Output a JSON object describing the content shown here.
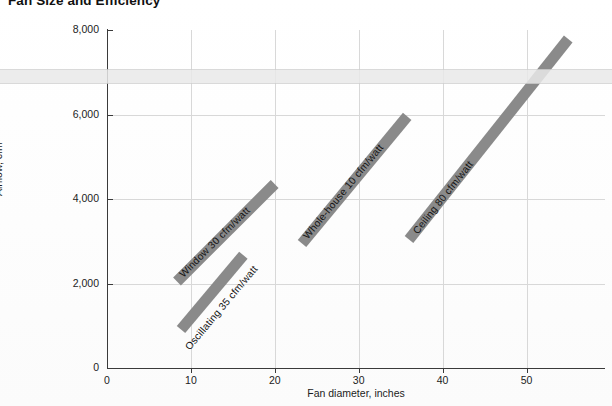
{
  "chart_data": {
    "type": "line",
    "title": "Fan Size and Efficiency",
    "xlabel": "Fan diameter, inches",
    "ylabel": "Airflow, cfm",
    "xlim": [
      0,
      59
    ],
    "ylim": [
      0,
      8000
    ],
    "xticks": [
      0,
      10,
      20,
      30,
      40,
      50
    ],
    "xtick_labels": [
      "0",
      "10",
      "20",
      "30",
      "40",
      "50"
    ],
    "yticks": [
      0,
      2000,
      4000,
      6000,
      8000
    ],
    "ytick_labels": [
      "0",
      "2,000",
      "4,000",
      "6,000",
      "8,000"
    ],
    "grid": true,
    "legend": "inline-annotations",
    "series": [
      {
        "name": "Window 30 cfm/watt",
        "label": "Window  30 cfm/watt",
        "efficiency_cfm_per_watt": 30,
        "x": [
          8.4,
          20.0
        ],
        "y": [
          2050,
          4350
        ],
        "color": "#8a8a8a"
      },
      {
        "name": "Oscillating 35 cfm/watt",
        "label": "Oscillating  35 cfm/watt",
        "efficiency_cfm_per_watt": 35,
        "x": [
          8.8,
          16.2
        ],
        "y": [
          900,
          2650
        ],
        "color": "#8a8a8a"
      },
      {
        "name": "Whole-house 10 cfm/watt",
        "label": "Whole-house 10 cfm/watt",
        "efficiency_cfm_per_watt": 10,
        "x": [
          23.3,
          35.8
        ],
        "y": [
          2950,
          5950
        ],
        "color": "#8a8a8a"
      },
      {
        "name": "Ceiling 80 cfm/watt",
        "label": "Ceiling  80 cfm/watt",
        "efficiency_cfm_per_watt": 80,
        "x": [
          36.0,
          55.0
        ],
        "y": [
          3050,
          7800
        ],
        "color": "#8a8a8a"
      }
    ]
  }
}
